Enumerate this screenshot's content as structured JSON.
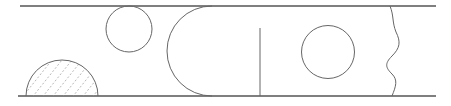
{
  "diagram": {
    "title": "",
    "canvas": {
      "width": 451,
      "height": 106
    },
    "colors": {
      "wall": "#555555",
      "shape": "#666666",
      "hatch": "#9a9a9a",
      "background": "#ffffff"
    },
    "walls": {
      "top": {
        "x1": 20,
        "x2": 436,
        "y": 6
      },
      "bottom": {
        "x1": 18,
        "x2": 436,
        "y": 96
      }
    },
    "elements": [
      {
        "id": "hatched-semicircle",
        "type": "semicircle",
        "cx": 62,
        "cy": 96,
        "r": 36,
        "fill": "hatched",
        "attached_to": "bottom-wall"
      },
      {
        "id": "top-circle",
        "type": "circle",
        "cx": 129,
        "cy": 29,
        "r": 23,
        "attached_to": "top-wall"
      },
      {
        "id": "d-arc",
        "type": "arc",
        "cx": 210,
        "cy": 51,
        "r": 45,
        "opening": "right"
      },
      {
        "id": "vertical-plate",
        "type": "line",
        "x": 260,
        "y1": 28,
        "y2": 96,
        "attached_to": "bottom-wall"
      },
      {
        "id": "center-circle",
        "type": "circle",
        "cx": 328,
        "cy": 52,
        "r": 26.5
      },
      {
        "id": "wavy-boundary",
        "type": "wavy-line",
        "x_start": 390,
        "x_end": 392
      }
    ],
    "labels": []
  }
}
